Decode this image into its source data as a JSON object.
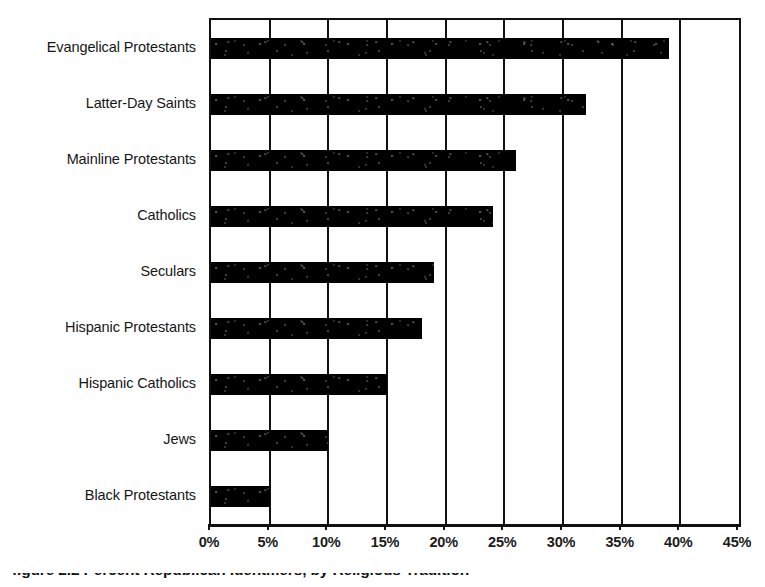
{
  "chart_data": {
    "type": "bar",
    "orientation": "horizontal",
    "title": "",
    "subtitle": "",
    "xlabel": "",
    "ylabel": "",
    "xlim": [
      0,
      45
    ],
    "xtick_step": 5,
    "grid": "vertical",
    "legend": "none",
    "bar_color": "#000000",
    "categories": [
      "Evangelical Protestants",
      "Latter-Day Saints",
      "Mainline Protestants",
      "Catholics",
      "Seculars",
      "Hispanic Protestants",
      "Hispanic Catholics",
      "Jews",
      "Black Protestants"
    ],
    "values": [
      39,
      32,
      26,
      24,
      19,
      18,
      15,
      10,
      5
    ],
    "value_labels": [
      "39%",
      "32%",
      "26%",
      "24%",
      "19%",
      "18%",
      "15%",
      "10%",
      "5%"
    ],
    "xticks": [
      0,
      5,
      10,
      15,
      20,
      25,
      30,
      35,
      40,
      45
    ],
    "xticklabels": [
      "0%",
      "5%",
      "10%",
      "15%",
      "20%",
      "25%",
      "30%",
      "35%",
      "40%",
      "45%"
    ]
  },
  "caption": {
    "text": "figure 2.2   Percent Republican Identifiers, by Religious Tradition"
  },
  "colors": {
    "bar": "#000000",
    "axis": "#111111",
    "text": "#1a1a1a",
    "background": "#ffffff"
  }
}
